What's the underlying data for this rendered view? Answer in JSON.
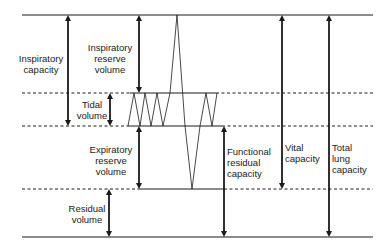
{
  "diagram": {
    "type": "lung-volumes-spirogram",
    "labels": {
      "inspiratory_capacity": "Inspiratory\ncapacity",
      "inspiratory_reserve_volume": "Inspiratory\nreserve\nvolume",
      "tidal_volume": "Tidal\nvolume",
      "expiratory_reserve_volume": "Expiratory\nreserve\nvolume",
      "residual_volume": "Residual\nvolume",
      "functional_residual_capacity": "Functional\nresidual\ncapacity",
      "vital_capacity": "Vital\ncapacity",
      "total_lung_capacity": "Total\nlung\ncapacity"
    },
    "levels": [
      {
        "name": "max-inspiration",
        "style": "solid"
      },
      {
        "name": "end-tidal-inspiration",
        "style": "dashed"
      },
      {
        "name": "end-tidal-expiration",
        "style": "dashed"
      },
      {
        "name": "max-expiration",
        "style": "dashed"
      },
      {
        "name": "zero-volume",
        "style": "solid"
      }
    ],
    "colors": {
      "line": "#1a1a1a",
      "background": "#ffffff"
    }
  }
}
